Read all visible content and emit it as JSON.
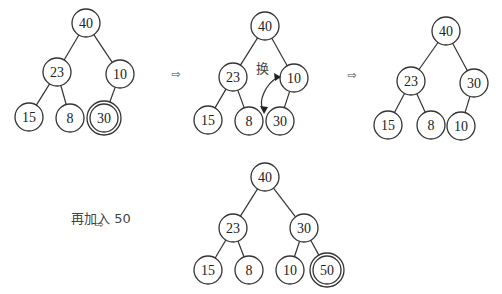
{
  "arrow_glyph": "⇨",
  "swap_label": "换",
  "insert_note": "再加入 50",
  "trees": [
    {
      "id": "tree-1",
      "nodes": [
        {
          "id": "a",
          "label": "40",
          "x": 86,
          "y": 23
        },
        {
          "id": "b",
          "label": "23",
          "x": 57,
          "y": 72
        },
        {
          "id": "c",
          "label": "10",
          "x": 120,
          "y": 74
        },
        {
          "id": "d",
          "label": "15",
          "x": 29,
          "y": 117
        },
        {
          "id": "e",
          "label": "8",
          "x": 70,
          "y": 118
        },
        {
          "id": "f",
          "label": "30",
          "x": 104,
          "y": 118,
          "double": true
        }
      ],
      "edges": [
        [
          "a",
          "b"
        ],
        [
          "a",
          "c"
        ],
        [
          "b",
          "d"
        ],
        [
          "b",
          "e"
        ],
        [
          "c",
          "f"
        ]
      ]
    },
    {
      "id": "tree-2",
      "nodes": [
        {
          "id": "a",
          "label": "40",
          "x": 265,
          "y": 26
        },
        {
          "id": "b",
          "label": "23",
          "x": 233,
          "y": 77
        },
        {
          "id": "c",
          "label": "10",
          "x": 294,
          "y": 78
        },
        {
          "id": "d",
          "label": "15",
          "x": 208,
          "y": 120
        },
        {
          "id": "e",
          "label": "8",
          "x": 249,
          "y": 121
        },
        {
          "id": "f",
          "label": "30",
          "x": 280,
          "y": 121
        }
      ],
      "edges": [
        [
          "a",
          "b"
        ],
        [
          "a",
          "c"
        ],
        [
          "b",
          "d"
        ],
        [
          "b",
          "e"
        ],
        [
          "c",
          "f"
        ]
      ]
    },
    {
      "id": "tree-3",
      "nodes": [
        {
          "id": "a",
          "label": "40",
          "x": 446,
          "y": 31
        },
        {
          "id": "b",
          "label": "23",
          "x": 411,
          "y": 81
        },
        {
          "id": "c",
          "label": "30",
          "x": 474,
          "y": 83
        },
        {
          "id": "d",
          "label": "15",
          "x": 388,
          "y": 125
        },
        {
          "id": "e",
          "label": "8",
          "x": 431,
          "y": 125
        },
        {
          "id": "f",
          "label": "10",
          "x": 461,
          "y": 126
        }
      ],
      "edges": [
        [
          "a",
          "b"
        ],
        [
          "a",
          "c"
        ],
        [
          "b",
          "d"
        ],
        [
          "b",
          "e"
        ],
        [
          "c",
          "f"
        ]
      ]
    },
    {
      "id": "tree-4",
      "nodes": [
        {
          "id": "a",
          "label": "40",
          "x": 265,
          "y": 177
        },
        {
          "id": "b",
          "label": "23",
          "x": 233,
          "y": 228
        },
        {
          "id": "c",
          "label": "30",
          "x": 304,
          "y": 228
        },
        {
          "id": "d",
          "label": "15",
          "x": 208,
          "y": 270
        },
        {
          "id": "e",
          "label": "8",
          "x": 249,
          "y": 270
        },
        {
          "id": "f",
          "label": "10",
          "x": 290,
          "y": 270
        },
        {
          "id": "g",
          "label": "50",
          "x": 327,
          "y": 270,
          "double": true
        }
      ],
      "edges": [
        [
          "a",
          "b"
        ],
        [
          "a",
          "c"
        ],
        [
          "b",
          "d"
        ],
        [
          "b",
          "e"
        ],
        [
          "c",
          "f"
        ],
        [
          "c",
          "g"
        ]
      ]
    }
  ],
  "arrows": [
    {
      "x": 176,
      "y": 78
    },
    {
      "x": 352,
      "y": 79
    },
    {
      "x": 99,
      "y": 228
    }
  ]
}
